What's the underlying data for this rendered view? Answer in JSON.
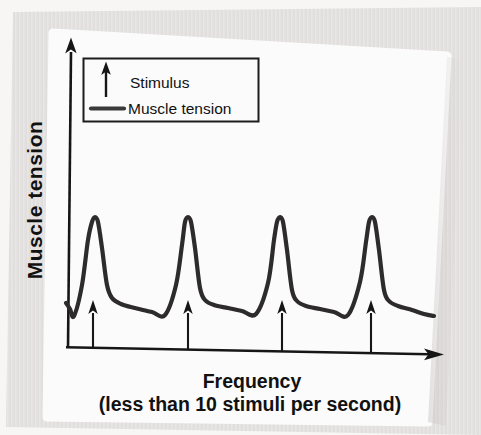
{
  "chart_data": {
    "type": "line",
    "title": "",
    "ylabel": "Muscle tension",
    "xlabel": "Frequency (less than 10 stimuli per second)",
    "xlabel_line1": "Frequency",
    "xlabel_line2": "(less than 10 stimuli per second)",
    "axes_numeric": false,
    "grid": false,
    "legend_position": "top-left-inside",
    "legend": [
      {
        "symbol": "up-arrow",
        "label": "Stimulus"
      },
      {
        "symbol": "line",
        "label": "Muscle tension"
      }
    ],
    "stimulus_count": 4,
    "stimuli_x_px": [
      93,
      188,
      282,
      371
    ],
    "curve_points_px": [
      [
        66,
        303
      ],
      [
        70,
        309
      ],
      [
        74,
        316
      ],
      [
        82,
        285
      ],
      [
        88,
        240
      ],
      [
        92,
        222
      ],
      [
        95,
        217
      ],
      [
        98,
        222
      ],
      [
        102,
        248
      ],
      [
        107,
        285
      ],
      [
        112,
        298
      ],
      [
        121,
        304
      ],
      [
        135,
        308
      ],
      [
        152,
        312
      ],
      [
        165,
        315
      ],
      [
        176,
        285
      ],
      [
        182,
        245
      ],
      [
        185,
        222
      ],
      [
        188,
        217
      ],
      [
        191,
        222
      ],
      [
        195,
        248
      ],
      [
        200,
        288
      ],
      [
        205,
        300
      ],
      [
        214,
        305
      ],
      [
        228,
        308
      ],
      [
        242,
        311
      ],
      [
        256,
        314
      ],
      [
        268,
        283
      ],
      [
        274,
        240
      ],
      [
        277,
        222
      ],
      [
        280,
        217
      ],
      [
        283,
        222
      ],
      [
        287,
        250
      ],
      [
        292,
        290
      ],
      [
        297,
        301
      ],
      [
        306,
        306
      ],
      [
        320,
        309
      ],
      [
        334,
        312
      ],
      [
        348,
        315
      ],
      [
        360,
        282
      ],
      [
        366,
        242
      ],
      [
        369,
        222
      ],
      [
        372,
        217
      ],
      [
        375,
        222
      ],
      [
        379,
        250
      ],
      [
        384,
        290
      ],
      [
        389,
        301
      ],
      [
        398,
        306
      ],
      [
        412,
        310
      ],
      [
        424,
        314
      ],
      [
        434,
        316
      ]
    ]
  },
  "colors": {
    "curve": "#2d2b2c",
    "axis": "#161616",
    "legend_border": "#1c1c1c",
    "legend_line_sample": "#3a3a3a",
    "text": "#111111",
    "paper": "#e5e3e2",
    "panel": "#fcfbfb"
  }
}
